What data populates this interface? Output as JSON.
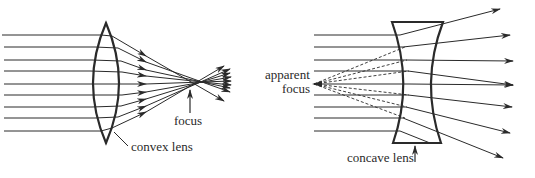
{
  "diagram": {
    "type": "optics",
    "panels": [
      {
        "id": "convex",
        "lens": "convex lens",
        "focus_label": "focus",
        "ray_count": 9
      },
      {
        "id": "concave",
        "lens": "concave lens",
        "focus_label_line1": "apparent",
        "focus_label_line2": "focus",
        "ray_count": 9
      }
    ]
  },
  "labels": {
    "convex_lens": "convex lens",
    "focus": "focus",
    "apparent": "apparent",
    "apparent_focus": "focus",
    "concave_lens": "concave lens"
  },
  "colors": {
    "ink": "#2a2a2a",
    "background": "#ffffff"
  }
}
